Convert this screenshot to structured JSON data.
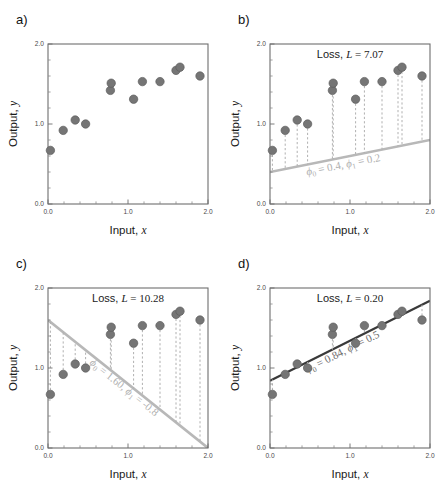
{
  "figure": {
    "panels": [
      "a)",
      "b)",
      "c)",
      "d)"
    ]
  },
  "axes": {
    "xlabel_text": "Input, ",
    "xlabel_sym": "x",
    "ylabel_text": "Output, ",
    "ylabel_sym": "y",
    "xticks": [
      "0.0",
      "1.0",
      "2.0"
    ],
    "xtick_values": [
      0.0,
      1.0,
      2.0
    ],
    "yticks": [
      "0.0",
      "1.0",
      "2.0"
    ],
    "ytick_values": [
      0.0,
      1.0,
      2.0
    ],
    "xlim": [
      0.0,
      2.0
    ],
    "ylim": [
      0.0,
      2.0
    ],
    "minor_tick_step": 0.2
  },
  "panels": {
    "a": {
      "letter": "a)",
      "loss_label": "",
      "param_label": "",
      "has_line": false,
      "has_residuals": false
    },
    "b": {
      "letter": "b)",
      "loss_prefix": "Loss, ",
      "loss_sym": "L",
      "loss_eq": " = ",
      "loss_value": "7.07",
      "param_phi0_sym": "ϕ",
      "param_phi0_sub": "0",
      "param_phi0_value": "0.4",
      "param_phi1_sym": "ϕ",
      "param_phi1_sub": "1",
      "param_phi1_value": "0.2",
      "param_label_plain": "ϕ0 = 0.4, ϕ1 = 0.2",
      "phi0": 0.4,
      "phi1": 0.2,
      "line_color": "#b8b8b8",
      "has_line": true,
      "has_residuals": true
    },
    "c": {
      "letter": "c)",
      "loss_prefix": "Loss, ",
      "loss_sym": "L",
      "loss_eq": " = ",
      "loss_value": "10.28",
      "param_phi0_sym": "ϕ",
      "param_phi0_sub": "0",
      "param_phi0_value": "1.60",
      "param_phi1_sym": "ϕ",
      "param_phi1_sub": "1",
      "param_phi1_value": "-0.8",
      "param_label_plain": "ϕ0 = 1.60, ϕ1 = -0.8",
      "phi0": 1.6,
      "phi1": -0.8,
      "line_color": "#b8b8b8",
      "has_line": true,
      "has_residuals": true
    },
    "d": {
      "letter": "d)",
      "loss_prefix": "Loss, ",
      "loss_sym": "L",
      "loss_eq": " = ",
      "loss_value": "0.20",
      "param_phi0_sym": "ϕ",
      "param_phi0_sub": "0",
      "param_phi0_value": "0.84",
      "param_phi1_sym": "ϕ",
      "param_phi1_sub": "1",
      "param_phi1_value": "0.5",
      "param_label_plain": "ϕ0 = 0.84, ϕ1 = 0.5",
      "phi0": 0.84,
      "phi1": 0.5,
      "line_color": "#3a3a3a",
      "has_line": true,
      "has_residuals": true
    }
  },
  "chart_data": {
    "type": "scatter",
    "xlabel": "Input, x",
    "ylabel": "Output, y",
    "xlim": [
      0.0,
      2.0
    ],
    "ylim": [
      0.0,
      2.0
    ],
    "grid": false,
    "legend": "none",
    "x": [
      0.03,
      0.19,
      0.34,
      0.47,
      0.78,
      0.79,
      1.07,
      1.18,
      1.4,
      1.6,
      1.65,
      1.9
    ],
    "y": [
      0.67,
      0.92,
      1.05,
      1.0,
      1.42,
      1.51,
      1.31,
      1.53,
      1.53,
      1.67,
      1.71,
      1.6
    ],
    "series": [
      {
        "name": "training data",
        "marker": "circle",
        "color": "#757575",
        "x": [
          0.03,
          0.19,
          0.34,
          0.47,
          0.78,
          0.79,
          1.07,
          1.18,
          1.4,
          1.6,
          1.65,
          1.9
        ],
        "y": [
          0.67,
          0.92,
          1.05,
          1.0,
          1.42,
          1.51,
          1.31,
          1.53,
          1.53,
          1.67,
          1.71,
          1.6
        ]
      }
    ],
    "fits": [
      {
        "panel": "a)",
        "line": null,
        "loss": null
      },
      {
        "panel": "b)",
        "line": {
          "intercept": 0.4,
          "slope": 0.2
        },
        "loss": 7.07,
        "color": "#b8b8b8"
      },
      {
        "panel": "c)",
        "line": {
          "intercept": 1.6,
          "slope": -0.8
        },
        "loss": 10.28,
        "color": "#b8b8b8"
      },
      {
        "panel": "d)",
        "line": {
          "intercept": 0.84,
          "slope": 0.5
        },
        "loss": 0.2,
        "color": "#3a3a3a"
      }
    ]
  }
}
